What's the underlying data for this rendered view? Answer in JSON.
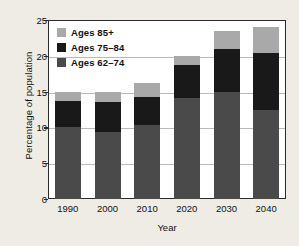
{
  "chart_data": {
    "type": "bar",
    "stacked": true,
    "title": "",
    "xlabel": "Year",
    "ylabel": "Percentage of population",
    "categories": [
      "1990",
      "2000",
      "2010",
      "2020",
      "2030",
      "2040"
    ],
    "yticks": [
      0,
      5,
      10,
      15,
      20,
      25
    ],
    "ylim": [
      0,
      25
    ],
    "grid": true,
    "legend_position": "top-left",
    "series": [
      {
        "name": "Ages 62–74",
        "color": "#4a4a4a",
        "values": [
          10.1,
          9.4,
          10.4,
          14.1,
          14.9,
          12.5
        ]
      },
      {
        "name": "Ages 75–84",
        "color": "#191919",
        "values": [
          3.6,
          4.2,
          3.8,
          4.6,
          6.0,
          7.9
        ]
      },
      {
        "name": "Ages 85+",
        "color": "#a9a9a9",
        "values": [
          1.3,
          1.3,
          2.0,
          1.3,
          2.6,
          3.6
        ]
      }
    ],
    "totals": [
      15.0,
      14.9,
      16.2,
      20.0,
      23.5,
      24.0
    ]
  },
  "legend": {
    "items": [
      {
        "label": "Ages 85+",
        "swatch": "s2"
      },
      {
        "label": "Ages 75–84",
        "swatch": "s1"
      },
      {
        "label": "Ages 62–74",
        "swatch": "s0"
      }
    ]
  }
}
